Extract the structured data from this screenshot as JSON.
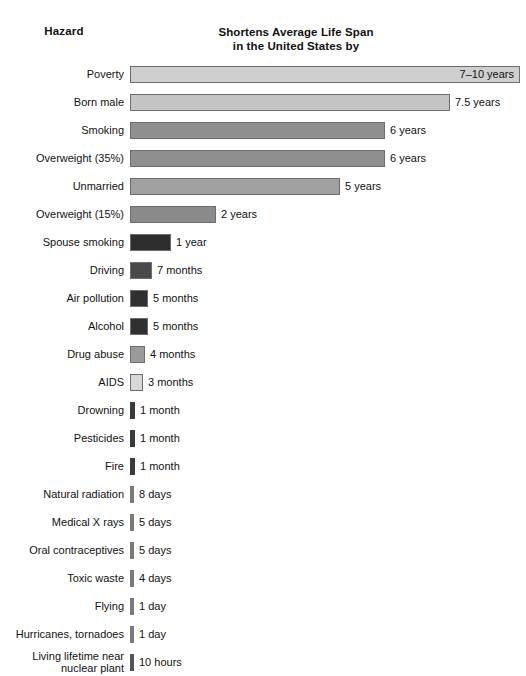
{
  "header": {
    "hazard_label": "Hazard",
    "title_line1": "Shortens Average Life Span",
    "title_line2": "in the United States by"
  },
  "chart_data": {
    "type": "bar",
    "orientation": "horizontal",
    "title": "Shortens Average Life Span in the United States by",
    "xlabel": "",
    "ylabel": "Hazard",
    "grid": false,
    "legend": "none",
    "axis_note": "Bar length is proportional to life-span reduction; values shown as text labels.",
    "categories": [
      "Poverty",
      "Born male",
      "Smoking",
      "Overweight (35%)",
      "Unmarried",
      "Overweight (15%)",
      "Spouse smoking",
      "Driving",
      "Air pollution",
      "Alcohol",
      "Drug abuse",
      "AIDS",
      "Drowning",
      "Pesticides",
      "Fire",
      "Natural radiation",
      "Medical X rays",
      "Oral contraceptives",
      "Toxic waste",
      "Flying",
      "Hurricanes, tornadoes",
      "Living lifetime near\nnuclear plant"
    ],
    "value_labels": [
      "7–10 years",
      "7.5 years",
      "6 years",
      "6 years",
      "5 years",
      "2 years",
      "1 year",
      "7 months",
      "5 months",
      "5 months",
      "4 months",
      "3 months",
      "1 month",
      "1 month",
      "1 month",
      "8 days",
      "5 days",
      "5 days",
      "4 days",
      "1 day",
      "1 day",
      "10 hours"
    ],
    "values_years": [
      8.5,
      7.5,
      6.0,
      6.0,
      5.0,
      2.0,
      1.0,
      0.583,
      0.417,
      0.417,
      0.333,
      0.25,
      0.083,
      0.083,
      0.083,
      0.0219,
      0.0137,
      0.0137,
      0.011,
      0.0027,
      0.0027,
      0.00114
    ],
    "bar_pixel_widths": [
      390,
      320,
      255,
      255,
      210,
      86,
      41,
      22,
      18,
      18,
      15,
      13,
      5,
      5,
      5,
      4,
      4,
      4,
      4,
      4,
      4,
      4
    ],
    "bar_colors": [
      "#cfcfcf",
      "#c4c4c4",
      "#8f8f8f",
      "#8f8f8f",
      "#a0a0a0",
      "#8a8a8a",
      "#2e2e2e",
      "#4a4a4a",
      "#303030",
      "#303030",
      "#9a9a9a",
      "#d8d8d8",
      "#3a3a3a",
      "#3a3a3a",
      "#3a3a3a",
      "#7a7a7a",
      "#7a7a7a",
      "#7a7a7a",
      "#7a7a7a",
      "#7a7a7a",
      "#7a7a7a",
      "#555555"
    ],
    "label_inside_bar": [
      true,
      false,
      false,
      false,
      false,
      false,
      false,
      false,
      false,
      false,
      false,
      false,
      false,
      false,
      false,
      false,
      false,
      false,
      false,
      false,
      false,
      false
    ],
    "thin_bar": [
      false,
      false,
      false,
      false,
      false,
      false,
      false,
      false,
      false,
      false,
      false,
      false,
      true,
      true,
      true,
      true,
      true,
      true,
      true,
      true,
      true,
      true
    ]
  }
}
